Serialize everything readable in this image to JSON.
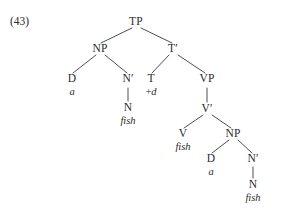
{
  "example": {
    "number_label": "(43)"
  },
  "tree": {
    "type": "syntax-tree",
    "description": "X-bar phrase structure tree for the sentence 'a fish fish a fish' showing head movement / verb raising",
    "line_color": "#3a3a3a",
    "text_color": "#2b2b2b",
    "background": "#ffffff",
    "nodes": [
      {
        "id": "TP",
        "label": "TP",
        "x": 136,
        "y": 22
      },
      {
        "id": "NP1",
        "label": "NP",
        "x": 100,
        "y": 49
      },
      {
        "id": "Tbar",
        "label": "T′",
        "x": 173,
        "y": 49
      },
      {
        "id": "D1",
        "label": "D",
        "x": 72,
        "y": 79
      },
      {
        "id": "Nbar1",
        "label": "N′",
        "x": 128,
        "y": 79
      },
      {
        "id": "T",
        "label": "T",
        "x": 151,
        "y": 79
      },
      {
        "id": "VP",
        "label": "VP",
        "x": 207,
        "y": 79
      },
      {
        "id": "N1",
        "label": "N",
        "x": 128,
        "y": 108
      },
      {
        "id": "Vbar",
        "label": "V′",
        "x": 207,
        "y": 109
      },
      {
        "id": "V",
        "label": "V",
        "x": 183,
        "y": 134
      },
      {
        "id": "NP2",
        "label": "NP",
        "x": 233,
        "y": 134
      },
      {
        "id": "D2",
        "label": "D",
        "x": 211,
        "y": 159
      },
      {
        "id": "Nbar2",
        "label": "N′",
        "x": 253,
        "y": 159
      },
      {
        "id": "N2",
        "label": "N",
        "x": 253,
        "y": 185
      }
    ],
    "terminals": [
      {
        "id": "term-a-1",
        "text": "a",
        "x": 72,
        "y": 92,
        "parent": "D1"
      },
      {
        "id": "term-fish-1",
        "text": "fish",
        "x": 128,
        "y": 121,
        "parent": "N1"
      },
      {
        "id": "term-fish-2",
        "text": "fish",
        "x": 183,
        "y": 147,
        "parent": "V"
      },
      {
        "id": "term-a-2",
        "text": "a",
        "x": 211,
        "y": 172,
        "parent": "D2"
      },
      {
        "id": "term-fish-3",
        "text": "fish",
        "x": 253,
        "y": 198,
        "parent": "N2"
      }
    ],
    "features": [
      {
        "id": "feat-plus-d",
        "prefix": "+",
        "value": "d",
        "x": 151,
        "y": 92,
        "parent": "T"
      }
    ],
    "edges": [
      {
        "from": "TP",
        "to": "NP1",
        "kind": "branch",
        "x1": 132,
        "y1": 28,
        "x2": 101,
        "y2": 43
      },
      {
        "from": "TP",
        "to": "Tbar",
        "kind": "branch",
        "x1": 141,
        "y1": 28,
        "x2": 172,
        "y2": 43
      },
      {
        "from": "NP1",
        "to": "D1",
        "kind": "branch",
        "x1": 96,
        "y1": 55,
        "x2": 73,
        "y2": 73
      },
      {
        "from": "NP1",
        "to": "Nbar1",
        "kind": "branch",
        "x1": 105,
        "y1": 55,
        "x2": 127,
        "y2": 73
      },
      {
        "from": "Nbar1",
        "to": "N1",
        "kind": "stem",
        "x1": 128,
        "y1": 88,
        "x2": 128,
        "y2": 101
      },
      {
        "from": "Tbar",
        "to": "T",
        "kind": "branch",
        "x1": 169,
        "y1": 55,
        "x2": 152,
        "y2": 73
      },
      {
        "from": "Tbar",
        "to": "VP",
        "kind": "branch",
        "x1": 178,
        "y1": 55,
        "x2": 205,
        "y2": 73
      },
      {
        "from": "VP",
        "to": "Vbar",
        "kind": "stem",
        "x1": 207,
        "y1": 88,
        "x2": 207,
        "y2": 102
      },
      {
        "from": "Vbar",
        "to": "V",
        "kind": "branch",
        "x1": 203,
        "y1": 115,
        "x2": 184,
        "y2": 128
      },
      {
        "from": "Vbar",
        "to": "NP2",
        "kind": "branch",
        "x1": 212,
        "y1": 115,
        "x2": 231,
        "y2": 128
      },
      {
        "from": "NP2",
        "to": "D2",
        "kind": "branch",
        "x1": 229,
        "y1": 140,
        "x2": 212,
        "y2": 153
      },
      {
        "from": "NP2",
        "to": "Nbar2",
        "kind": "branch",
        "x1": 238,
        "y1": 140,
        "x2": 252,
        "y2": 153
      },
      {
        "from": "Nbar2",
        "to": "N2",
        "kind": "stem",
        "x1": 253,
        "y1": 167,
        "x2": 253,
        "y2": 178
      }
    ]
  }
}
